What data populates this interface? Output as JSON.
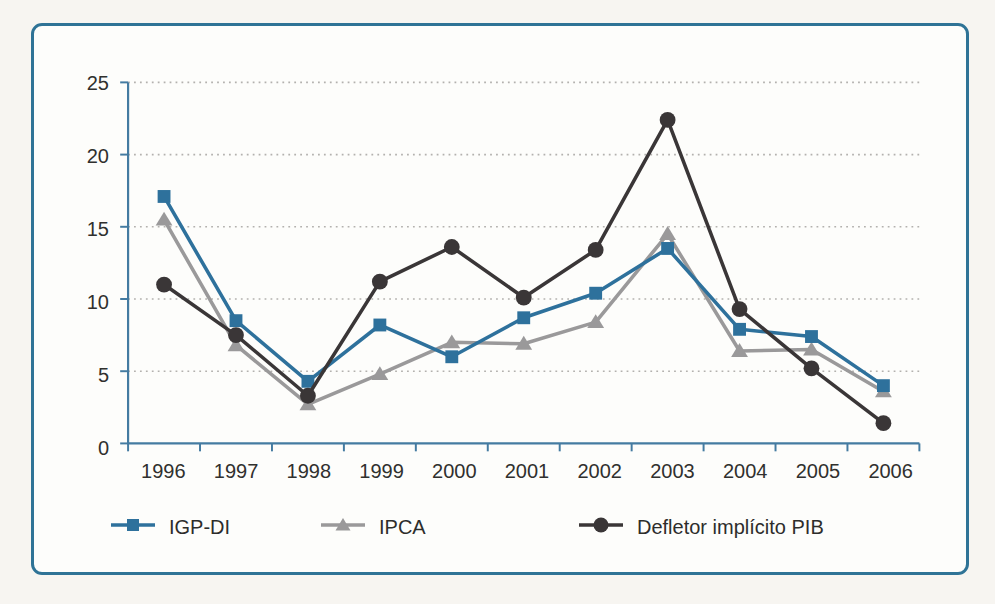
{
  "page": {
    "background": "#f7f5f1"
  },
  "panel": {
    "border_color": "#2f7396",
    "background": "#fdfdfb"
  },
  "axis": {
    "line_color": "#447ba1",
    "tick_color": "#447ba1",
    "label_color": "#30302e"
  },
  "grid": {
    "color": "#b3b1ae",
    "style": "dotted"
  },
  "chart_data": {
    "type": "line",
    "x": [
      "1996",
      "1997",
      "1998",
      "1999",
      "2000",
      "2001",
      "2002",
      "2003",
      "2004",
      "2005",
      "2006"
    ],
    "series": [
      {
        "name": "IGP-DI",
        "marker": "square",
        "color": "#2e719c",
        "values": [
          17.1,
          8.5,
          4.3,
          8.2,
          6.0,
          8.7,
          10.4,
          13.5,
          7.9,
          7.4,
          4.0
        ]
      },
      {
        "name": "IPCA",
        "marker": "triangle",
        "color": "#9a999a",
        "values": [
          15.5,
          6.8,
          2.7,
          4.8,
          7.0,
          6.9,
          8.4,
          14.5,
          6.4,
          6.5,
          3.6
        ]
      },
      {
        "name": "Defletor implícito PIB",
        "marker": "circle",
        "color": "#3a3637",
        "values": [
          11.0,
          7.5,
          3.3,
          11.2,
          13.6,
          10.1,
          13.4,
          22.4,
          9.3,
          5.2,
          1.4
        ]
      }
    ],
    "ylim": [
      0,
      25
    ],
    "yticks": [
      0,
      5,
      10,
      15,
      20,
      25
    ],
    "title": "",
    "xlabel": "",
    "ylabel": "",
    "grid": "horizontal-dotted",
    "legend_position": "bottom"
  }
}
